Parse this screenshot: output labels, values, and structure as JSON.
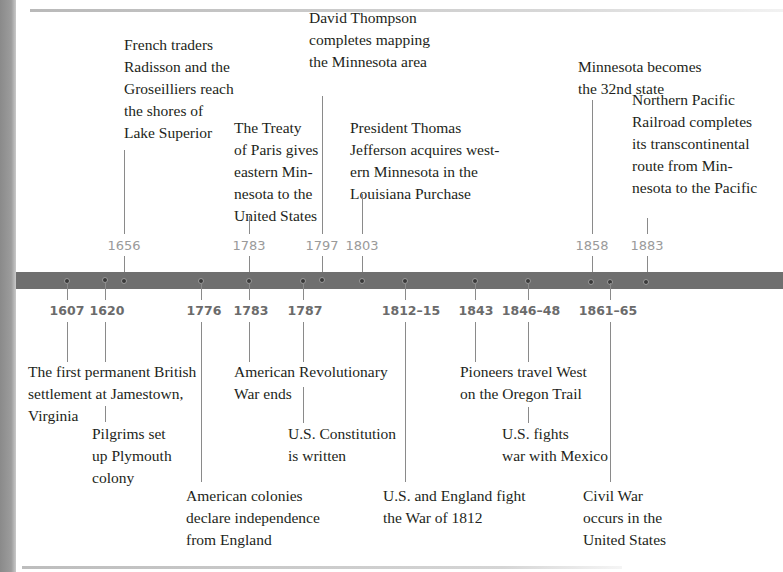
{
  "header": {
    "title": "MINNESOTA AND U.S. HISTORY",
    "title_partially_visible": true
  },
  "colors": {
    "timeline_bar": "#6f6f6f",
    "year_above": "#9a9a9a",
    "year_below": "#6b6b6b",
    "text": "#231f20",
    "left_band": "#9c9c9c"
  },
  "above_events": [
    {
      "year": "1656",
      "text": "French traders\nRadisson and the\nGroseilliers reach\nthe shores of\nLake Superior"
    },
    {
      "year": "1783",
      "text": "The Treaty\nof Paris gives\neastern Min-\nnesota to the\nUnited States"
    },
    {
      "year": "1797",
      "text": "David Thompson\ncompletes mapping\nthe Minnesota area"
    },
    {
      "year": "1803",
      "text": "President Thomas\nJefferson acquires west-\nern Minnesota in the\nLouisiana Purchase"
    },
    {
      "year": "1858",
      "text": "Minnesota becomes\nthe 32nd state"
    },
    {
      "year": "1883",
      "text": "Northern Pacific\nRailroad completes\nits transcontinental\nroute from Min-\nnesota to the Pacific"
    }
  ],
  "below_events": [
    {
      "year": "1607",
      "text": "The first permanent British\nsettlement at Jamestown,\nVirginia"
    },
    {
      "year": "1620",
      "text": "Pilgrims set\nup Plymouth\ncolony"
    },
    {
      "year": "1776",
      "text": "American colonies\ndeclare independence\nfrom England"
    },
    {
      "year": "1783",
      "text": "American Revolutionary\nWar ends"
    },
    {
      "year": "1787",
      "text": "U.S. Constitution\nis written"
    },
    {
      "year": "1812–15",
      "text": "U.S. and England fight\nthe War of 1812"
    },
    {
      "year": "1843",
      "text": "Pioneers travel West\non the Oregon Trail"
    },
    {
      "year": "1846–48",
      "text": "U.S. fights\nwar with Mexico"
    },
    {
      "year": "1861–65",
      "text": "Civil War\noccurs in the\nUnited States"
    }
  ]
}
